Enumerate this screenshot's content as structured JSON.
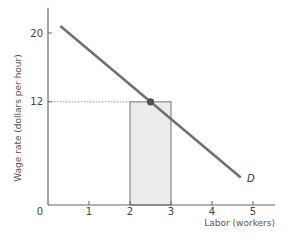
{
  "chart_data": {
    "type": "line",
    "title": "",
    "xlabel": "Labor (workers)",
    "ylabel": "Wage rate (dollars per hour)",
    "xlim": [
      0,
      5.5
    ],
    "ylim": [
      0,
      22
    ],
    "x_ticks": [
      0,
      1,
      2,
      3,
      4,
      5
    ],
    "x_tick_labels": [
      "0",
      "1",
      "2",
      "3",
      "4",
      "5"
    ],
    "y_ticks": [
      12,
      20
    ],
    "y_tick_labels": [
      "12",
      "20"
    ],
    "grid": false,
    "legend": "none",
    "series": [
      {
        "name": "D",
        "type": "line",
        "x": [
          0.3,
          4.7
        ],
        "y": [
          20.8,
          3.2
        ],
        "color": "#707070"
      }
    ],
    "highlight_point": {
      "x": 2.5,
      "y": 12,
      "color": "#505050"
    },
    "reference_line": {
      "type": "horizontal-dotted",
      "y": 12,
      "x_from": 0,
      "x_to": 2.5
    },
    "shaded_bar": {
      "x_from": 2,
      "x_to": 3,
      "y_from": 0,
      "y_to": 12,
      "fill": "#ececec",
      "stroke": "#888888"
    },
    "annotations": [
      {
        "text": "D",
        "x": 4.9,
        "y": 3.1
      }
    ]
  },
  "labels": {
    "ylabel": "Wage rate (dollars per hour)",
    "xlabel": "Labor (workers)",
    "origin": "0",
    "curve": "D"
  }
}
